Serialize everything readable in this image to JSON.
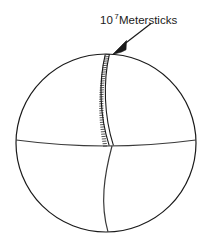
{
  "figure": {
    "title": "",
    "background_color": "#ffffff",
    "stroke_color": "#1a1a1a",
    "fill_color": "#ffffff",
    "annotation": {
      "mantissa": "10",
      "exponent": "7",
      "unit_label": " Metersticks",
      "full_text": "10^7 Metersticks",
      "color": "#1a1a1a"
    },
    "sphere": {
      "name": "sphere-outline",
      "center_x": 106,
      "center_y": 143,
      "radius_x": 90,
      "radius_y": 89
    },
    "equator": {
      "name": "equator-line",
      "label": "equator"
    },
    "meridian": {
      "name": "meridian-line",
      "label": "meridian"
    },
    "meterstick_strip": {
      "name": "meterstick-strip",
      "label": "metersticks laid end to end along meridian",
      "rung_count": 42
    },
    "pointer": {
      "name": "leader-arrow",
      "label": "arrow pointing to meterstick strip"
    }
  }
}
